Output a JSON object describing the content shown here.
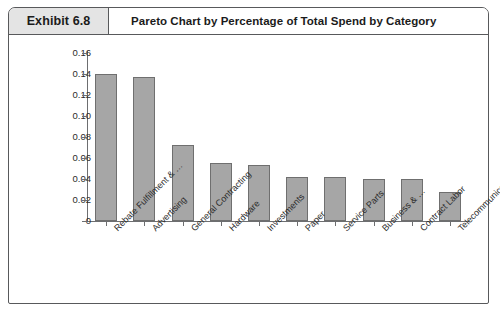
{
  "exhibit": {
    "tag": "Exhibit 6.8",
    "title": "Pareto Chart by Percentage of Total Spend by Category"
  },
  "chart_data": {
    "type": "bar",
    "title": "Pareto Chart by Percentage of Total Spend by Category",
    "xlabel": "",
    "ylabel": "",
    "ylim": [
      0,
      0.16
    ],
    "grid": false,
    "legend": "none",
    "y_ticks": [
      "0.16",
      "0.14",
      "0.12",
      "0.10",
      "0.08",
      "0.06",
      "0.04",
      "0.02",
      "0"
    ],
    "y_tick_values": [
      0.16,
      0.14,
      0.12,
      0.1,
      0.08,
      0.06,
      0.04,
      0.02,
      0
    ],
    "categories": [
      "Rebate Fulfillment & …",
      "Advertising",
      "General Contracting",
      "Hardware",
      "Investments",
      "Paper",
      "Service Parts",
      "Business & …",
      "Contract Labor",
      "Telecommunications"
    ],
    "values": [
      0.14,
      0.137,
      0.072,
      0.055,
      0.053,
      0.042,
      0.042,
      0.04,
      0.04,
      0.028
    ],
    "bar_color": "#a6a6a6",
    "bar_edge_color": "#6f6f6f",
    "axis_color": "#6d6e70"
  }
}
